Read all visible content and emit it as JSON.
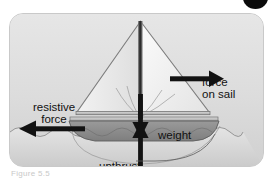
{
  "figure": {
    "panel": {
      "background_color": "#dcdcdc",
      "border_color": "#c9c9c9"
    },
    "corner_marker": {
      "name": "page-corner-dot",
      "color": "#0a0a0a"
    },
    "labels": {
      "resistive_force": "resistive\nforce",
      "resistive_force_line1": "resistive",
      "resistive_force_line2": "force",
      "force_on_sail_line1": "force",
      "force_on_sail_line2": "on sail",
      "weight": "weight",
      "upthrust": "upthrust"
    },
    "caption": "Figure 5.5",
    "arrows": [
      {
        "name": "resistive-force-arrow",
        "direction": "left",
        "label": "resistive force",
        "color": "#111111"
      },
      {
        "name": "force-on-sail-arrow",
        "direction": "right",
        "label": "force on sail",
        "color": "#111111"
      },
      {
        "name": "weight-arrow",
        "direction": "down",
        "label": "weight",
        "color": "#111111"
      },
      {
        "name": "upthrust-arrow",
        "direction": "up",
        "label": "upthrust",
        "color": "#111111"
      }
    ],
    "scene": {
      "boat": {
        "hull_color": "#8d8d8d",
        "sail_color": "#f4f4f4",
        "mast_color": "#2a2a2a",
        "deck_color": "#b8b8b8"
      },
      "water": {
        "surface_color": "#e9e9e9",
        "below_color": "#d2d2d2"
      }
    }
  }
}
